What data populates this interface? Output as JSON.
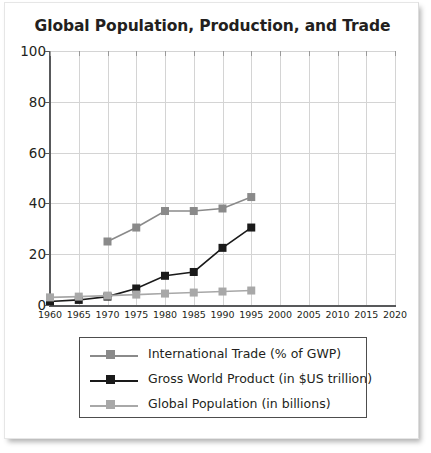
{
  "chart_data": {
    "type": "line",
    "title": "Global Population, Production, and Trade",
    "xlabel": "",
    "ylabel": "",
    "xlim": [
      1960,
      2020
    ],
    "ylim": [
      0,
      100
    ],
    "grid": true,
    "legend_position": "bottom",
    "x": [
      1960,
      1965,
      1970,
      1975,
      1980,
      1985,
      1990,
      1995
    ],
    "xticks": [
      "1960",
      "1965",
      "1970",
      "1975",
      "1980",
      "1985",
      "1990",
      "1995",
      "2000",
      "2005",
      "2010",
      "2015",
      "2020"
    ],
    "yticks": [
      "0",
      "20",
      "40",
      "60",
      "80",
      "100"
    ],
    "series": [
      {
        "name": "International Trade (% of GWP)",
        "color": "#8a8a8a",
        "x": [
          1970,
          1975,
          1980,
          1985,
          1990,
          1995
        ],
        "values": [
          25.0,
          30.5,
          37.0,
          37.0,
          38.0,
          42.5
        ]
      },
      {
        "name": "Gross World Product (in $US trillion)",
        "color": "#1a1a1a",
        "x": [
          1960,
          1965,
          1970,
          1975,
          1980,
          1985,
          1990,
          1995
        ],
        "values": [
          1.4,
          2.0,
          3.3,
          6.5,
          11.5,
          13.0,
          22.5,
          30.5
        ]
      },
      {
        "name": "Global Population (in billions)",
        "color": "#a8a8a8",
        "x": [
          1960,
          1965,
          1970,
          1975,
          1980,
          1985,
          1990,
          1995
        ],
        "values": [
          3.0,
          3.3,
          3.7,
          4.1,
          4.5,
          4.9,
          5.3,
          5.7
        ]
      }
    ]
  },
  "legend": {
    "entries": [
      {
        "label": "International Trade (% of GWP)"
      },
      {
        "label": "Gross World Product (in $US trillion)"
      },
      {
        "label": "Global Population (in billions)"
      }
    ]
  }
}
